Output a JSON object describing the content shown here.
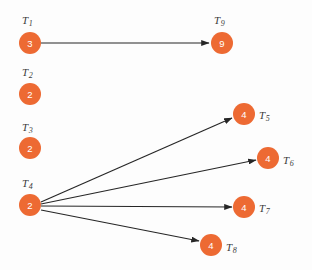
{
  "figure": {
    "type": "directed-graph",
    "width": 312,
    "height": 270,
    "background_color": "#fdfdfd"
  },
  "style": {
    "node_fill": "#ed6a33",
    "node_radius": 11,
    "node_value_color": "#ffffff",
    "node_label_color": "#3a3a3a",
    "edge_color": "#262626",
    "edge_width": 1.2
  },
  "nodes": [
    {
      "id": "T1",
      "label": "T",
      "subscript": "1",
      "value": "3",
      "cx": 30,
      "cy": 43,
      "label_x": 22,
      "label_y": 20,
      "label_anchor": "start"
    },
    {
      "id": "T2",
      "label": "T",
      "subscript": "2",
      "value": "2",
      "cx": 30,
      "cy": 94,
      "label_x": 22,
      "label_y": 72,
      "label_anchor": "start"
    },
    {
      "id": "T3",
      "label": "T",
      "subscript": "3",
      "value": "2",
      "cx": 30,
      "cy": 148,
      "label_x": 22,
      "label_y": 127,
      "label_anchor": "start"
    },
    {
      "id": "T4",
      "label": "T",
      "subscript": "4",
      "value": "2",
      "cx": 30,
      "cy": 205,
      "label_x": 22,
      "label_y": 183,
      "label_anchor": "start"
    },
    {
      "id": "T9",
      "label": "T",
      "subscript": "9",
      "value": "9",
      "cx": 222,
      "cy": 43,
      "label_x": 214,
      "label_y": 20,
      "label_anchor": "start"
    },
    {
      "id": "T5",
      "label": "T",
      "subscript": "5",
      "value": "4",
      "cx": 244,
      "cy": 114,
      "label_x": 259,
      "label_y": 115,
      "label_anchor": "start"
    },
    {
      "id": "T6",
      "label": "T",
      "subscript": "6",
      "value": "4",
      "cx": 268,
      "cy": 158,
      "label_x": 283,
      "label_y": 160,
      "label_anchor": "start"
    },
    {
      "id": "T7",
      "label": "T",
      "subscript": "7",
      "value": "4",
      "cx": 244,
      "cy": 207,
      "label_x": 259,
      "label_y": 208,
      "label_anchor": "start"
    },
    {
      "id": "T8",
      "label": "T",
      "subscript": "8",
      "value": "4",
      "cx": 211,
      "cy": 245,
      "label_x": 226,
      "label_y": 247,
      "label_anchor": "start"
    }
  ],
  "edges": [
    {
      "id": "T1-T9",
      "from": "T1",
      "to": "T9",
      "x1": 41,
      "y1": 43,
      "x2": 209,
      "y2": 43
    },
    {
      "id": "T4-T5",
      "from": "T4",
      "to": "T5",
      "x1": 41,
      "y1": 202,
      "x2": 232,
      "y2": 118
    },
    {
      "id": "T4-T6",
      "from": "T4",
      "to": "T6",
      "x1": 41,
      "y1": 204,
      "x2": 256,
      "y2": 160
    },
    {
      "id": "T4-T7",
      "from": "T4",
      "to": "T7",
      "x1": 41,
      "y1": 206,
      "x2": 232,
      "y2": 207
    },
    {
      "id": "T4-T8",
      "from": "T4",
      "to": "T8",
      "x1": 41,
      "y1": 210,
      "x2": 199,
      "y2": 241
    }
  ],
  "graph_summary": {
    "node_count": 9,
    "edge_count": 5,
    "isolated_nodes": [
      "T2",
      "T3"
    ],
    "root_nodes": [
      "T1",
      "T4"
    ]
  }
}
